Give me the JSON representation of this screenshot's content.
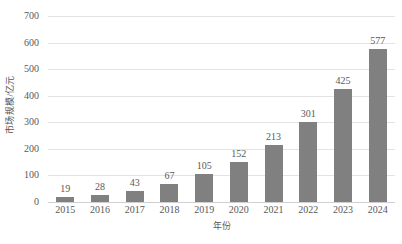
{
  "chart_data": {
    "type": "bar",
    "title": "",
    "xlabel": "年份",
    "ylabel": "市场规模/亿元",
    "categories": [
      "2015",
      "2016",
      "2017",
      "2018",
      "2019",
      "2020",
      "2021",
      "2022",
      "2023",
      "2024"
    ],
    "values": [
      19,
      28,
      43,
      67,
      105,
      152,
      213,
      301,
      425,
      577
    ],
    "ylim": [
      0,
      700
    ],
    "yticks": [
      0,
      100,
      200,
      300,
      400,
      500,
      600,
      700
    ],
    "ytick_labels": [
      "0",
      "100",
      "200",
      "300",
      "400",
      "500",
      "600",
      "700"
    ],
    "grid": true,
    "legend": false,
    "data_labels": [
      "19",
      "28",
      "43",
      "67",
      "105",
      "152",
      "213",
      "301",
      "425",
      "577"
    ],
    "series": [
      {
        "name": "市场规模/亿元",
        "values": [
          19,
          28,
          43,
          67,
          105,
          152,
          213,
          301,
          425,
          577
        ],
        "color": "#808080"
      }
    ],
    "colors": {
      "bar": "#808080",
      "gridline": "#e3e3e3",
      "baseline": "#d0d0d0",
      "text": "#595959",
      "background": "#ffffff"
    }
  }
}
